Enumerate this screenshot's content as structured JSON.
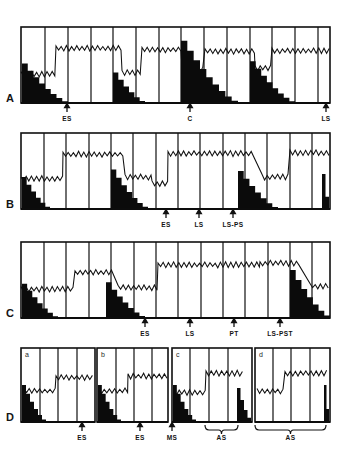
{
  "figure": {
    "title": "",
    "background_color": "#ffffff",
    "ink_color": "#0b0b0b",
    "panel_letters": [
      "A",
      "B",
      "C",
      "D"
    ]
  },
  "chart_data": {
    "type": "line",
    "subtitle": "",
    "xlabel": "",
    "ylabel": "",
    "grid": false,
    "legend_position": "none",
    "axis_ranges": {
      "x": [
        0,
        100
      ],
      "y": [
        0,
        100
      ]
    },
    "panels": [
      {
        "letter": "A",
        "frame": {
          "x": 21,
          "y": 27,
          "w": 309,
          "h": 76
        },
        "dividers": [
          45,
          68,
          91,
          113,
          136,
          159,
          181,
          204,
          227,
          250,
          272,
          295,
          318
        ],
        "trace_segments": [
          {
            "x0": 21,
            "x1": 56,
            "level": 0.38
          },
          {
            "x0": 56,
            "x1": 122,
            "level": 0.72
          },
          {
            "x0": 122,
            "x1": 142,
            "level": 0.4
          },
          {
            "x0": 142,
            "x1": 182,
            "level": 0.7
          },
          {
            "x0": 182,
            "x1": 205,
            "level": 0.44
          },
          {
            "x0": 205,
            "x1": 255,
            "level": 0.68
          },
          {
            "x0": 255,
            "x1": 272,
            "level": 0.46
          },
          {
            "x0": 272,
            "x1": 330,
            "level": 0.69
          }
        ],
        "black_blocks": [
          {
            "x0": 22,
            "x1": 68,
            "h0": 0.52,
            "steps": 8
          },
          {
            "x0": 113,
            "x1": 145,
            "h0": 0.4,
            "steps": 6
          },
          {
            "x0": 181,
            "x1": 238,
            "h0": 0.82,
            "steps": 9
          },
          {
            "x0": 250,
            "x1": 295,
            "h0": 0.55,
            "steps": 8
          }
        ],
        "markers": [
          {
            "label": "ES",
            "x": 67,
            "type": "arrow"
          },
          {
            "label": "C",
            "x": 190,
            "type": "arrow"
          },
          {
            "label": "LS",
            "x": 326,
            "type": "arrow"
          }
        ]
      },
      {
        "letter": "B",
        "frame": {
          "x": 21,
          "y": 133,
          "w": 309,
          "h": 76
        },
        "dividers": [
          44,
          66,
          89,
          111,
          133,
          156,
          178,
          200,
          223,
          245,
          267,
          290,
          312
        ],
        "trace_segments": [
          {
            "x0": 21,
            "x1": 63,
            "level": 0.4
          },
          {
            "x0": 63,
            "x1": 125,
            "level": 0.72
          },
          {
            "x0": 125,
            "x1": 152,
            "level": 0.42
          },
          {
            "x0": 152,
            "x1": 168,
            "level": 0.33
          },
          {
            "x0": 168,
            "x1": 253,
            "level": 0.73
          },
          {
            "x0": 262,
            "x1": 290,
            "level": 0.42
          },
          {
            "x0": 290,
            "x1": 330,
            "level": 0.74
          }
        ],
        "black_blocks": [
          {
            "x0": 22,
            "x1": 50,
            "h0": 0.42,
            "steps": 6
          },
          {
            "x0": 111,
            "x1": 148,
            "h0": 0.52,
            "steps": 7
          },
          {
            "x0": 238,
            "x1": 278,
            "h0": 0.5,
            "steps": 7
          },
          {
            "x0": 322,
            "x1": 329,
            "h0": 0.46,
            "steps": 2
          }
        ],
        "markers": [
          {
            "label": "ES",
            "x": 166,
            "type": "arrow"
          },
          {
            "label": "LS",
            "x": 199,
            "type": "arrow"
          },
          {
            "label": "LS-PS",
            "x": 233,
            "type": "arrow"
          }
        ]
      },
      {
        "letter": "C",
        "frame": {
          "x": 21,
          "y": 242,
          "w": 309,
          "h": 76
        },
        "dividers": [
          44,
          66,
          89,
          111,
          134,
          156,
          178,
          201,
          223,
          245,
          268,
          290,
          312
        ],
        "trace_segments": [
          {
            "x0": 21,
            "x1": 75,
            "level": 0.38
          },
          {
            "x0": 75,
            "x1": 112,
            "level": 0.6
          },
          {
            "x0": 118,
            "x1": 158,
            "level": 0.4
          },
          {
            "x0": 158,
            "x1": 260,
            "level": 0.7
          },
          {
            "x0": 260,
            "x1": 300,
            "level": 0.72
          },
          {
            "x0": 310,
            "x1": 330,
            "level": 0.42
          }
        ],
        "black_blocks": [
          {
            "x0": 22,
            "x1": 58,
            "h0": 0.45,
            "steps": 7
          },
          {
            "x0": 106,
            "x1": 145,
            "h0": 0.47,
            "steps": 7
          },
          {
            "x0": 290,
            "x1": 330,
            "h0": 0.63,
            "steps": 7
          }
        ],
        "markers": [
          {
            "label": "ES",
            "x": 145,
            "type": "arrow"
          },
          {
            "label": "LS",
            "x": 190,
            "type": "arrow"
          },
          {
            "label": "PT",
            "x": 234,
            "type": "arrow"
          },
          {
            "label": "LS-PST",
            "x": 280,
            "type": "arrow"
          }
        ]
      },
      {
        "letter": "D",
        "subpanels": [
          {
            "label": "a",
            "frame": {
              "x": 21,
              "y": 348,
              "w": 74,
              "h": 74
            },
            "dividers": [
              40,
              58,
              77
            ],
            "trace_segments": [
              {
                "x0": 24,
                "x1": 56,
                "level": 0.42
              },
              {
                "x0": 56,
                "x1": 94,
                "level": 0.6
              }
            ],
            "black_blocks": [
              {
                "x0": 22,
                "x1": 46,
                "h0": 0.5,
                "steps": 6
              }
            ]
          },
          {
            "label": "b",
            "frame": {
              "x": 97,
              "y": 348,
              "w": 71,
              "h": 74
            },
            "dividers": [
              116,
              134,
              152
            ],
            "trace_segments": [
              {
                "x0": 99,
                "x1": 128,
                "level": 0.42
              },
              {
                "x0": 128,
                "x1": 167,
                "level": 0.62
              }
            ],
            "black_blocks": [
              {
                "x0": 98,
                "x1": 121,
                "h0": 0.5,
                "steps": 6
              }
            ]
          },
          {
            "label": "c",
            "frame": {
              "x": 172,
              "y": 348,
              "w": 80,
              "h": 74
            },
            "dividers": [
              190,
              209,
              228
            ],
            "trace_segments": [
              {
                "x0": 174,
                "x1": 206,
                "level": 0.4
              },
              {
                "x0": 206,
                "x1": 244,
                "level": 0.66
              }
            ],
            "black_blocks": [
              {
                "x0": 173,
                "x1": 196,
                "h0": 0.5,
                "steps": 6
              },
              {
                "x0": 237,
                "x1": 251,
                "h0": 0.46,
                "steps": 4
              }
            ]
          },
          {
            "label": "d",
            "frame": {
              "x": 255,
              "y": 348,
              "w": 75,
              "h": 74
            },
            "dividers": [
              273,
              291,
              310
            ],
            "trace_segments": [
              {
                "x0": 257,
                "x1": 285,
                "level": 0.42
              },
              {
                "x0": 285,
                "x1": 329,
                "level": 0.66
              }
            ],
            "black_blocks": [
              {
                "x0": 324,
                "x1": 329,
                "h0": 0.5,
                "steps": 2
              }
            ]
          }
        ],
        "markers": [
          {
            "label": "ES",
            "x": 82,
            "type": "arrow"
          },
          {
            "label": "ES",
            "x": 140,
            "type": "arrow"
          },
          {
            "label": "MS",
            "x": 172,
            "type": "arrow"
          },
          {
            "label": "AS",
            "x": 221,
            "type": "brace",
            "x0": 205,
            "x1": 238
          },
          {
            "label": "AS",
            "x": 290,
            "type": "brace",
            "x0": 255,
            "x1": 326
          }
        ]
      }
    ]
  }
}
